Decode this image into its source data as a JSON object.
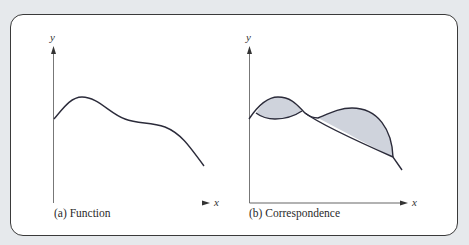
{
  "figure": {
    "panels": [
      {
        "id": "a",
        "caption": "(a) Function",
        "x_axis_label": "x",
        "y_axis_label": "y",
        "description": "single-valued smooth curve"
      },
      {
        "id": "b",
        "caption": "(b) Correspondence",
        "x_axis_label": "x",
        "y_axis_label": "y",
        "description": "multi-valued curve with shaded regions between branches"
      }
    ],
    "colors": {
      "background": "#e6e9ec",
      "frame_border": "#3a3a3a",
      "curve": "#2b2b3a",
      "shade_fill": "#cfd3dc",
      "axis": "#555555"
    }
  }
}
